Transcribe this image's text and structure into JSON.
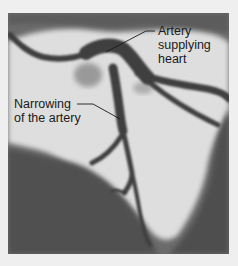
{
  "figure": {
    "type": "coronary angiogram",
    "labels": {
      "artery": {
        "lines": [
          "Artery",
          "supplying",
          "heart"
        ]
      },
      "narrowing": {
        "lines": [
          "Narrowing",
          "of the artery"
        ]
      }
    },
    "colors": {
      "background": "#efefef",
      "bright_region": "#e6e6e6",
      "dark_region": "#505050",
      "vessel": "#3a3a3a",
      "text": "#1a1a1a"
    }
  }
}
